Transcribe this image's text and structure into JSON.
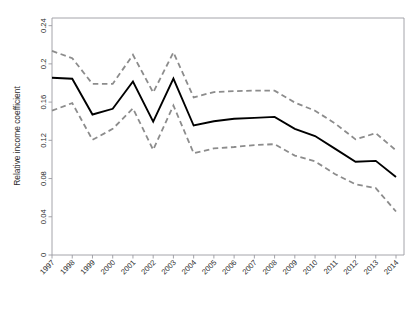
{
  "chart_data": {
    "type": "line",
    "title": "",
    "subtitle": "",
    "xlabel": "",
    "ylabel": "Relative income coefficient",
    "x": [
      "1997",
      "1998",
      "1999",
      "2000",
      "2001",
      "2002",
      "2003",
      "2004",
      "2005",
      "2006",
      "2007",
      "2008",
      "2009",
      "2010",
      "2011",
      "2012",
      "2013",
      "2014"
    ],
    "xtick_labels": [
      "1997",
      "1998",
      "1999",
      "2000",
      "2001",
      "2002",
      "2003",
      "2004",
      "2005",
      "2006",
      "2007",
      "2008",
      "2009",
      "2010",
      "2011",
      "2012",
      "2013",
      "2014"
    ],
    "ytick_labels": [
      "0",
      "0.04",
      "0.08",
      "0.12",
      "0.16",
      "0.2",
      "0.24"
    ],
    "ytick_values": [
      0,
      0.04,
      0.08,
      0.12,
      0.16,
      0.2,
      0.24
    ],
    "ylim": [
      0,
      0.248
    ],
    "xlim": [
      "1997",
      "2014"
    ],
    "grid": false,
    "legend": "none",
    "series": [
      {
        "name": "Relative income coefficient",
        "style": "solid",
        "color": "#000000",
        "width": 1.9,
        "values": [
          0.1855,
          0.1845,
          0.147,
          0.153,
          0.1815,
          0.1395,
          0.1845,
          0.1355,
          0.14,
          0.1425,
          0.1435,
          0.1445,
          0.132,
          0.1245,
          0.111,
          0.0975,
          0.0985,
          0.0815
        ]
      },
      {
        "name": "Upper 95% confidence limit",
        "style": "dashed",
        "color": "#8c8c8c",
        "width": 1.8,
        "values": [
          0.2135,
          0.206,
          0.179,
          0.179,
          0.2095,
          0.17,
          0.212,
          0.165,
          0.1705,
          0.1715,
          0.172,
          0.172,
          0.1595,
          0.151,
          0.1375,
          0.121,
          0.1275,
          0.1095
        ]
      },
      {
        "name": "Lower 95% confidence limit",
        "style": "dashed",
        "color": "#8c8c8c",
        "width": 1.8,
        "values": [
          0.151,
          0.159,
          0.1205,
          0.132,
          0.1535,
          0.11,
          0.1565,
          0.1065,
          0.1115,
          0.113,
          0.115,
          0.116,
          0.104,
          0.098,
          0.0845,
          0.074,
          0.07,
          0.0455
        ]
      }
    ],
    "axes": {
      "frame_color": "#9a9aa0",
      "tick_color": "#9a9aa0",
      "text_color": "#2b2b2b"
    }
  }
}
